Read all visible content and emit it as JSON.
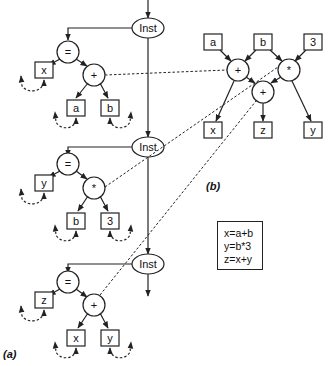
{
  "figure": {
    "part_a_label": "(a)",
    "part_b_label": "(b)",
    "inst_label": "Inst",
    "instructions": [
      {
        "op_root": "=",
        "target": "x",
        "op": "+",
        "left": "a",
        "right": "b"
      },
      {
        "op_root": "=",
        "target": "y",
        "op": "*",
        "left": "b",
        "right": "3"
      },
      {
        "op_root": "=",
        "target": "z",
        "op": "+",
        "left": "x",
        "right": "y"
      }
    ],
    "dag": {
      "inputs": [
        "a",
        "b",
        "3"
      ],
      "ops": [
        "+",
        "*",
        "+"
      ],
      "outputs": [
        "x",
        "z",
        "y"
      ]
    },
    "equations": [
      "x=a+b",
      "y=b*3",
      "z=x+y"
    ]
  },
  "colors": {
    "stroke": "#222222",
    "background": "#ffffff"
  }
}
